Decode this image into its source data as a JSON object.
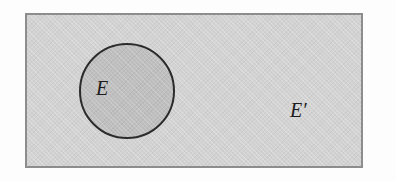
{
  "diagram": {
    "type": "venn-diagram",
    "background_color": "#fdfdfd",
    "universe": {
      "shape": "rectangle",
      "meaning": "universal set",
      "fill_color": "#d2d2d2",
      "border_color": "#8d8d8d",
      "border_width_px": 2,
      "x": 25,
      "y": 13,
      "width": 338,
      "height": 155
    },
    "set": {
      "shape": "circle",
      "label": "E",
      "meaning": "event E",
      "fill_color": "#bfbfbf",
      "border_color": "#2b2b2b",
      "border_width_px": 2,
      "center_x": 127,
      "center_y": 91,
      "radius": 48
    },
    "complement": {
      "label": "E′",
      "meaning": "complement of E",
      "label_x": 270,
      "label_y": 95
    }
  }
}
